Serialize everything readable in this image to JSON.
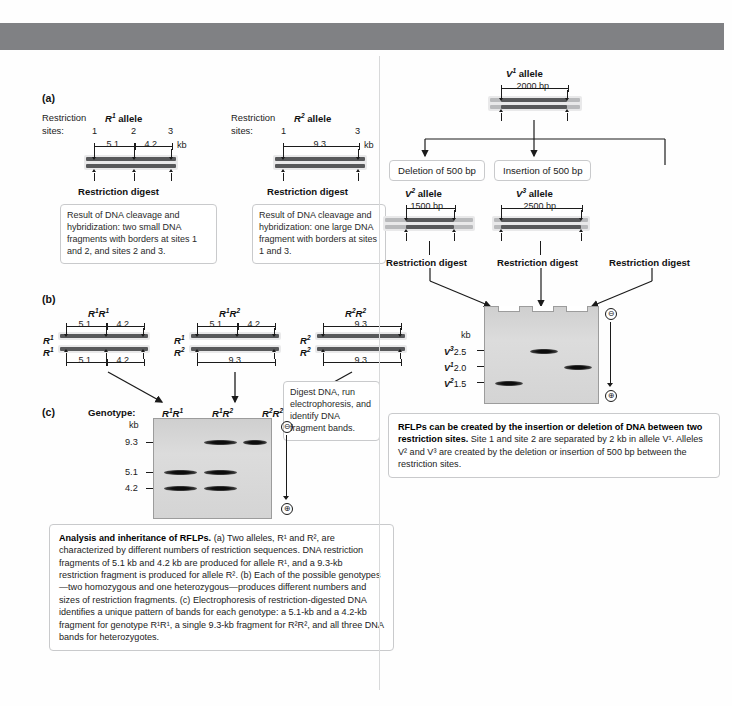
{
  "figure": {
    "panel_a_letter": "(a)",
    "panel_b_letter": "(b)",
    "panel_c_letter": "(c)"
  },
  "panel_a": {
    "left": {
      "restriction_label_1": "Restriction",
      "restriction_label_2": "sites:",
      "allele_name": "R",
      "allele_sup": "1",
      "allele_word": "allele",
      "sites": [
        "1",
        "2",
        "3"
      ],
      "seg1": "5.1",
      "seg2": "4.2",
      "unit": "kb",
      "digest_label": "Restriction digest",
      "note": "Result of DNA cleavage and hybridization: two small DNA fragments with borders at sites 1 and 2, and sites 2 and 3."
    },
    "right": {
      "restriction_label_1": "Restriction",
      "restriction_label_2": "sites:",
      "allele_name": "R",
      "allele_sup": "2",
      "allele_word": "allele",
      "sites": [
        "1",
        "3"
      ],
      "seg1": "9.3",
      "unit": "kb",
      "digest_label": "Restriction digest",
      "note": "Result of DNA cleavage and hybridization: one large DNA fragment with borders at sites 1 and 3."
    }
  },
  "panel_b": {
    "genotypes": [
      {
        "title_a": "R",
        "title_a_sup": "1",
        "title_b": "R",
        "title_b_sup": "1",
        "top_left_label": "R",
        "top_left_sup": "1",
        "bottom_left_label": "R",
        "bottom_left_sup": "1",
        "top_segments": [
          "5.1",
          "4.2"
        ],
        "bottom_segments": [
          "5.1",
          "4.2"
        ]
      },
      {
        "title_a": "R",
        "title_a_sup": "1",
        "title_b": "R",
        "title_b_sup": "2",
        "top_left_label": "R",
        "top_left_sup": "1",
        "bottom_left_label": "R",
        "bottom_left_sup": "2",
        "top_segments": [
          "5.1",
          "4.2"
        ],
        "bottom_segments": [
          "9.3"
        ]
      },
      {
        "title_a": "R",
        "title_a_sup": "2",
        "title_b": "R",
        "title_b_sup": "2",
        "top_left_label": "R",
        "top_left_sup": "2",
        "bottom_left_label": "R",
        "bottom_left_sup": "2",
        "top_segments": [
          "9.3"
        ],
        "bottom_segments": [
          "9.3"
        ]
      }
    ],
    "digest_note": "Digest DNA, run electrophoresis, and identify DNA fragment bands."
  },
  "panel_c": {
    "genotype_label": "Genotype:",
    "lanes": [
      {
        "a": "R",
        "a_sup": "1",
        "b": "R",
        "b_sup": "1"
      },
      {
        "a": "R",
        "a_sup": "1",
        "b": "R",
        "b_sup": "2"
      },
      {
        "a": "R",
        "a_sup": "2",
        "b": "R",
        "b_sup": "2"
      }
    ],
    "kb_label": "kb",
    "markers": [
      "9.3",
      "5.1",
      "4.2"
    ],
    "bands": [
      {
        "lane": 1,
        "marker": "5.1"
      },
      {
        "lane": 1,
        "marker": "4.2"
      },
      {
        "lane": 2,
        "marker": "9.3"
      },
      {
        "lane": 2,
        "marker": "5.1"
      },
      {
        "lane": 2,
        "marker": "4.2"
      },
      {
        "lane": 3,
        "marker": "9.3"
      }
    ],
    "neg_pole": "⊖",
    "pos_pole": "⊕"
  },
  "panel_v": {
    "parent": {
      "allele_name": "V",
      "allele_sup": "1",
      "allele_word": "allele",
      "length": "2000 bp"
    },
    "event_left": "Deletion of 500 bp",
    "event_middle": "Insertion of 500 bp",
    "child_left": {
      "allele_name": "V",
      "allele_sup": "2",
      "allele_word": "allele",
      "length": "1500 bp"
    },
    "child_middle": {
      "allele_name": "V",
      "allele_sup": "3",
      "allele_word": "allele",
      "length": "2500 bp"
    },
    "digest_labels": [
      "Restriction digest",
      "Restriction digest",
      "Restriction digest"
    ],
    "gel": {
      "kb_label": "kb",
      "markers": [
        {
          "allele": "V",
          "sup": "3",
          "value": "2.5"
        },
        {
          "allele": "V",
          "sup": "1",
          "value": "2.0"
        },
        {
          "allele": "V",
          "sup": "2",
          "value": "1.5"
        }
      ],
      "bands": [
        {
          "lane": 1,
          "marker": "1.5"
        },
        {
          "lane": 2,
          "marker": "2.5"
        },
        {
          "lane": 3,
          "marker": "2.0"
        }
      ],
      "neg_pole": "⊖",
      "pos_pole": "⊕"
    },
    "caption_bold": "RFLPs can be created by the insertion or deletion of DNA between two restriction sites.",
    "caption_rest": " Site 1 and site 2 are separated by 2 kb in allele V¹. Alleles V² and V³ are created by the deletion or insertion of 500 bp between the restriction sites."
  },
  "main_caption": {
    "bold": "Analysis and inheritance of RFLPs.",
    "rest": " (a) Two alleles, R¹ and R², are characterized by different numbers of restriction sequences. DNA restriction fragments of 5.1 kb and 4.2 kb are produced for allele R¹, and a 9.3-kb restriction fragment is produced for allele R². (b) Each of the possible genotypes—two homozygous and one heterozygous—produces different numbers and sizes of restriction fragments. (c) Electrophoresis of restriction-digested DNA identifies a unique pattern of bands for each genotype: a 5.1-kb and a 4.2-kb fragment for genotype R¹R¹, a single 9.3-kb fragment for R²R², and all three DNA bands for heterozygotes."
  },
  "colors": {
    "banner": "#808184",
    "dna_dark": "#58595b",
    "dna_light": "#b9babc",
    "gel_bg": "#d7d7d7",
    "box_border": "#c9cacc"
  }
}
